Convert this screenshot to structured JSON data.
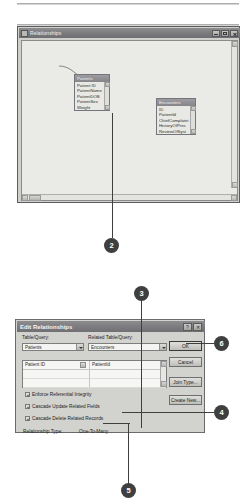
{
  "relationships_window": {
    "title": "Relationships",
    "titlebar_buttons": [
      "minimize",
      "maximize",
      "close"
    ],
    "tables": [
      {
        "name": "Patients",
        "fields": [
          "Patient ID",
          "PatientName",
          "PatientDOB",
          "PatientSex",
          "Weight"
        ],
        "primary_key": "Patient ID"
      },
      {
        "name": "Encounters",
        "fields": [
          "ID",
          "PatientId",
          "ChiefComplaint",
          "HistoryOfPres",
          "ReviewOfSyst"
        ],
        "primary_key": "ID"
      }
    ]
  },
  "dialog": {
    "title": "Edit Relationships",
    "help_button": "?",
    "close_button": "✕",
    "left_label": "Table/Query:",
    "right_label": "Related Table/Query:",
    "left_table": "Patients",
    "right_table": "Encounters",
    "left_field": "Patient ID",
    "right_field": "PatientId",
    "checkboxes": [
      {
        "label": "Enforce Referential Integrity",
        "checked": true
      },
      {
        "label": "Cascade Update Related Fields",
        "checked": true
      },
      {
        "label": "Cascade Delete Related Records",
        "checked": true
      }
    ],
    "relationship_type_label": "Relationship Type:",
    "relationship_type_value": "One-To-Many",
    "buttons": [
      {
        "label": "OK",
        "primary": true
      },
      {
        "label": "Cancel",
        "primary": false
      },
      {
        "label": "Join Type...",
        "primary": false
      },
      {
        "label": "Create New...",
        "primary": false
      }
    ]
  },
  "callouts": [
    {
      "number": "2"
    },
    {
      "number": "3"
    },
    {
      "number": "4"
    },
    {
      "number": "5"
    },
    {
      "number": "6"
    }
  ],
  "colors": {
    "callout_fill": "#3f3f3f",
    "window_chrome": "#6e6e72",
    "canvas": "#eaeae6",
    "dialog_face": "#d2d2ce"
  }
}
